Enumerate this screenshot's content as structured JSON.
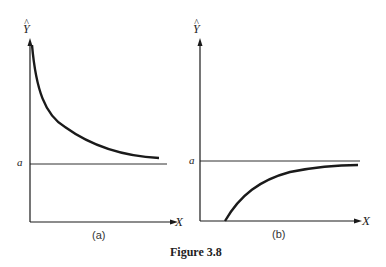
{
  "figure": {
    "caption": "Figure 3.8"
  },
  "panels": [
    {
      "id": "a",
      "label": "(a)",
      "y_axis": "Y",
      "y_hat": "^",
      "x_axis": "X",
      "asymptote_label": "a",
      "curve": "decreasing toward a"
    },
    {
      "id": "b",
      "label": "(b)",
      "y_axis": "Y",
      "y_hat": "^",
      "x_axis": "X",
      "asymptote_label": "a",
      "curve": "increasing toward a"
    }
  ],
  "colors": {
    "ink": "#1a1a1a",
    "background": "#ffffff"
  }
}
